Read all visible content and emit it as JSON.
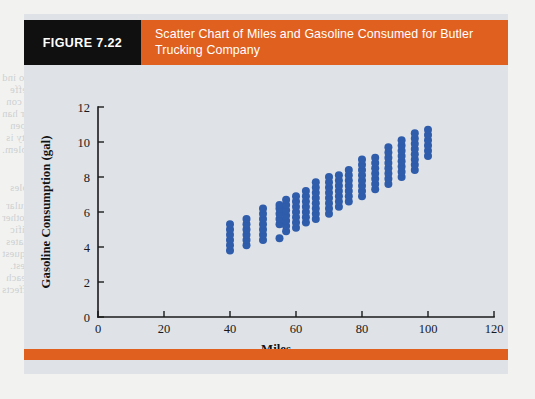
{
  "page": {
    "background_color": "#f2f3f1",
    "bleed_text": [
      "in these mules since they are in the regression model. When two ind",
      "ning to include substantial multicollinearity is present and this effe",
      "two gasoline consumption data that the variable of the unique con",
      "consumption with mileage is difficult to interpret. On the other han",
      "the relationship is used to predict or estimate the value of the depen",
      "increasing chance in a regression analysis, then multicollinearity is",
      "variable, then multicollinearity is not a serious problem.",
      "Inference and Very Large Samples",
      "Consider the statement that every unit that has a particular",
      "provided by researchers when they apply for grants and other",
      "in contrast for the entire gate's data's subject and the signific",
      "school educations, and analysis of trends of the estimates",
      "that regression values have low results of the trends and request",
      "including the company low results of the trends and request.",
      "the interest of Readings will peculiar likely to be understanding each",
      "biological preference was supposedly can to illustrate the effects",
      "Chapter 7    Linear Regre"
    ]
  },
  "figure": {
    "tag": "FIGURE 7.22",
    "title": "Scatter Chart of Miles and Gasoline Consumed for Butler Trucking Company",
    "tag_bg": "#101010",
    "title_bg": "#e0601f",
    "card_bg": "#dfe3e8",
    "footer_bar_color": "#e0601f"
  },
  "chart_data": {
    "type": "scatter",
    "title": "Scatter Chart of Miles and Gasoline Consumed for Butler Trucking Company",
    "xlabel": "Miles",
    "ylabel": "Gasoline Consumption (gal)",
    "xlim": [
      0,
      120
    ],
    "ylim": [
      0,
      12
    ],
    "xticks": [
      0,
      20,
      40,
      60,
      80,
      100,
      120
    ],
    "yticks": [
      0,
      2,
      4,
      6,
      8,
      10,
      12
    ],
    "xtick_labels": [
      "0",
      "20",
      "40",
      "60",
      "80",
      "100",
      "120"
    ],
    "ytick_labels": [
      "0",
      "2",
      "4",
      "6",
      "8",
      "10",
      "12"
    ],
    "grid": false,
    "legend": false,
    "marker_color": "#2f5cab",
    "marker_size": 4.0,
    "points": [
      [
        40,
        3.8
      ],
      [
        40,
        4.1
      ],
      [
        40,
        4.4
      ],
      [
        40,
        4.7
      ],
      [
        40,
        5.0
      ],
      [
        40,
        5.3
      ],
      [
        45,
        4.1
      ],
      [
        45,
        4.4
      ],
      [
        45,
        4.7
      ],
      [
        45,
        5.0
      ],
      [
        45,
        5.3
      ],
      [
        45,
        5.6
      ],
      [
        50,
        4.4
      ],
      [
        50,
        4.7
      ],
      [
        50,
        5.0
      ],
      [
        50,
        5.3
      ],
      [
        50,
        5.6
      ],
      [
        50,
        5.9
      ],
      [
        50,
        6.2
      ],
      [
        55,
        4.5
      ],
      [
        55,
        5.3
      ],
      [
        55,
        5.6
      ],
      [
        55,
        5.9
      ],
      [
        55,
        6.2
      ],
      [
        55,
        6.4
      ],
      [
        57,
        4.9
      ],
      [
        57,
        5.2
      ],
      [
        57,
        5.5
      ],
      [
        57,
        5.8
      ],
      [
        57,
        6.1
      ],
      [
        57,
        6.4
      ],
      [
        57,
        6.7
      ],
      [
        60,
        5.1
      ],
      [
        60,
        5.4
      ],
      [
        60,
        5.7
      ],
      [
        60,
        6.0
      ],
      [
        60,
        6.3
      ],
      [
        60,
        6.6
      ],
      [
        60,
        6.9
      ],
      [
        63,
        5.4
      ],
      [
        63,
        5.7
      ],
      [
        63,
        6.0
      ],
      [
        63,
        6.3
      ],
      [
        63,
        6.6
      ],
      [
        63,
        6.9
      ],
      [
        63,
        7.2
      ],
      [
        66,
        5.6
      ],
      [
        66,
        5.9
      ],
      [
        66,
        6.2
      ],
      [
        66,
        6.5
      ],
      [
        66,
        6.8
      ],
      [
        66,
        7.1
      ],
      [
        66,
        7.4
      ],
      [
        66,
        7.7
      ],
      [
        70,
        5.9
      ],
      [
        70,
        6.2
      ],
      [
        70,
        6.5
      ],
      [
        70,
        6.8
      ],
      [
        70,
        7.1
      ],
      [
        70,
        7.4
      ],
      [
        70,
        7.7
      ],
      [
        70,
        8.0
      ],
      [
        73,
        6.3
      ],
      [
        73,
        6.6
      ],
      [
        73,
        6.9
      ],
      [
        73,
        7.2
      ],
      [
        73,
        7.5
      ],
      [
        73,
        7.8
      ],
      [
        73,
        8.1
      ],
      [
        76,
        6.6
      ],
      [
        76,
        6.9
      ],
      [
        76,
        7.2
      ],
      [
        76,
        7.5
      ],
      [
        76,
        7.8
      ],
      [
        76,
        8.1
      ],
      [
        76,
        8.4
      ],
      [
        80,
        6.9
      ],
      [
        80,
        7.2
      ],
      [
        80,
        7.5
      ],
      [
        80,
        7.8
      ],
      [
        80,
        8.1
      ],
      [
        80,
        8.4
      ],
      [
        80,
        8.7
      ],
      [
        80,
        9.0
      ],
      [
        84,
        7.3
      ],
      [
        84,
        7.6
      ],
      [
        84,
        7.9
      ],
      [
        84,
        8.2
      ],
      [
        84,
        8.5
      ],
      [
        84,
        8.8
      ],
      [
        84,
        9.1
      ],
      [
        88,
        7.6
      ],
      [
        88,
        7.9
      ],
      [
        88,
        8.2
      ],
      [
        88,
        8.5
      ],
      [
        88,
        8.8
      ],
      [
        88,
        9.1
      ],
      [
        88,
        9.4
      ],
      [
        88,
        9.7
      ],
      [
        92,
        8.0
      ],
      [
        92,
        8.3
      ],
      [
        92,
        8.6
      ],
      [
        92,
        8.9
      ],
      [
        92,
        9.2
      ],
      [
        92,
        9.5
      ],
      [
        92,
        9.8
      ],
      [
        92,
        10.1
      ],
      [
        96,
        8.4
      ],
      [
        96,
        8.7
      ],
      [
        96,
        9.0
      ],
      [
        96,
        9.3
      ],
      [
        96,
        9.6
      ],
      [
        96,
        9.9
      ],
      [
        96,
        10.2
      ],
      [
        96,
        10.5
      ],
      [
        100,
        9.2
      ],
      [
        100,
        9.5
      ],
      [
        100,
        9.8
      ],
      [
        100,
        10.1
      ],
      [
        100,
        10.4
      ],
      [
        100,
        10.7
      ]
    ]
  }
}
